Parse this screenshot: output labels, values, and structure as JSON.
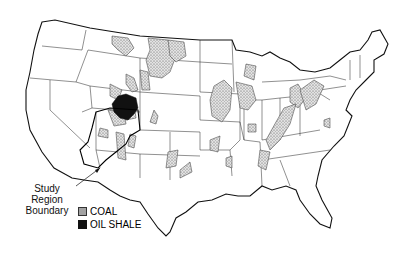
{
  "map": {
    "title": "United States coal and oil shale regions",
    "region": "Contiguous United States",
    "annotations": {
      "study_region_label_line1": "Study Region",
      "study_region_label_line2": "Boundary"
    },
    "legend": {
      "items": [
        {
          "label": "COAL",
          "symbol": "stippled-fill"
        },
        {
          "label": "OIL SHALE",
          "symbol": "solid-black-fill"
        }
      ]
    },
    "colors": {
      "outline": "#111111",
      "coal_fill": "#d0d0d0",
      "oil_shale_fill": "#111111",
      "background": "#ffffff"
    }
  }
}
